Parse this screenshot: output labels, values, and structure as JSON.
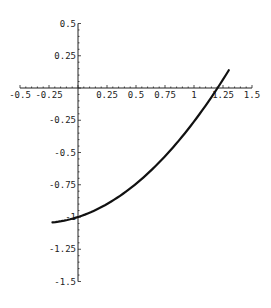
{
  "chart_data": {
    "type": "line",
    "title": "",
    "xlabel": "",
    "ylabel": "",
    "xlim": [
      -0.5,
      1.5
    ],
    "ylim": [
      -1.5,
      0.5
    ],
    "grid": false,
    "legend": null,
    "x_ticks": [
      -0.5,
      -0.25,
      0.25,
      0.5,
      0.75,
      1,
      1.25,
      1.5
    ],
    "x_tick_labels": [
      "-0.5",
      "-0.25",
      "0.25",
      "0.5",
      "0.75",
      "1",
      "1.25",
      "1.5"
    ],
    "y_ticks": [
      0.5,
      0.25,
      -0.25,
      -0.5,
      -0.75,
      -1,
      -1.25,
      -1.5
    ],
    "y_tick_labels": [
      "0.5",
      "0.25",
      "-0.25",
      "-0.5",
      "-0.75",
      "-1",
      "-1.25",
      "-1.5"
    ],
    "series": [
      {
        "name": "curve",
        "color": "#111111",
        "x": [
          -0.22,
          0.0,
          0.2,
          0.4,
          0.6,
          0.8,
          1.0,
          1.2,
          1.3
        ],
        "y": [
          -1.042,
          -1.0,
          -0.924,
          -0.812,
          -0.664,
          -0.48,
          -0.26,
          -0.004,
          0.137
        ]
      }
    ]
  }
}
